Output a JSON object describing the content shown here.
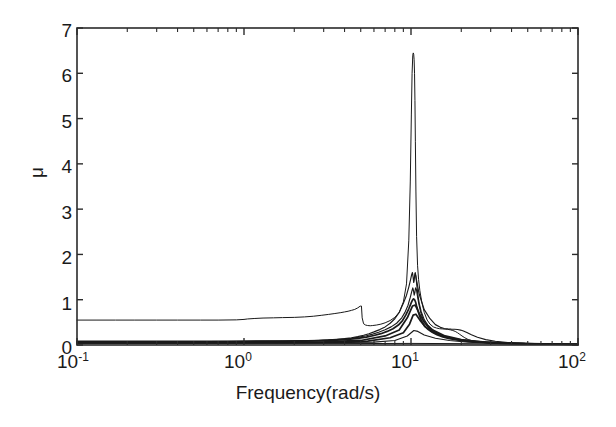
{
  "chart_data": {
    "type": "line",
    "title": "",
    "subtitle": "",
    "xlabel": "Frequency(rad/s)",
    "ylabel": "μ",
    "xscale": "log",
    "yscale": "linear",
    "xlim": [
      0.1,
      100
    ],
    "ylim": [
      0,
      7
    ],
    "grid": false,
    "legend": null,
    "legend_position": "none",
    "xticks": [
      0.1,
      1,
      10,
      100
    ],
    "xtick_labels": [
      "10⁻¹",
      "10⁰",
      "10¹",
      "10²"
    ],
    "xtick_mantissas": [
      "10",
      "10",
      "10",
      "10"
    ],
    "xtick_exponents": [
      "-1",
      "0",
      "1",
      "2"
    ],
    "yticks": [
      0,
      1,
      2,
      3,
      4,
      5,
      6,
      7
    ],
    "ytick_labels": [
      "0",
      "1",
      "2",
      "3",
      "4",
      "5",
      "6",
      "7"
    ],
    "minor_ticks": true,
    "line_color": "#1a1a1a",
    "background_color": "#ffffff",
    "axis_color": "#2b2b2b",
    "annotations": [
      {
        "text": "main resonance peak",
        "x": 10.5,
        "y": 6.45
      },
      {
        "text": "secondary peaks cluster",
        "x": 10.6,
        "y": 1.6
      },
      {
        "text": "low-frequency plateau upper curve",
        "x": 0.1,
        "y": 0.55
      },
      {
        "text": "anti-resonance notch",
        "x": 5.6,
        "y": 0.42
      },
      {
        "text": "local bump before notch",
        "x": 5.0,
        "y": 0.86
      }
    ],
    "series": [
      {
        "name": "upper-bound-curve",
        "width": "thin",
        "x": [
          0.1,
          0.13,
          0.17,
          0.22,
          0.3,
          0.4,
          0.55,
          0.7,
          0.9,
          1.0,
          1.05,
          1.15,
          1.3,
          1.5,
          1.7,
          2.0,
          2.3,
          2.6,
          2.9,
          3.2,
          3.5,
          3.8,
          4.0,
          4.2,
          4.4,
          4.6,
          4.8,
          4.95,
          5.0,
          5.05,
          5.1,
          5.2,
          5.35,
          5.5,
          5.7,
          5.9,
          6.2,
          6.6,
          7.0,
          7.5,
          8.0,
          8.5,
          9.0,
          9.4,
          9.7,
          9.9,
          10.05,
          10.15,
          10.25,
          10.32,
          10.38,
          10.44,
          10.5,
          10.56,
          10.62,
          10.7,
          10.8,
          10.95,
          11.1,
          11.3,
          11.6,
          12.0,
          12.5,
          13.0,
          13.6,
          14.2,
          14.8,
          15.4,
          16.0,
          16.6,
          17.2,
          17.8,
          18.4,
          19.0,
          19.6,
          20.2,
          21.0,
          22.0,
          23.5,
          25.0,
          27.0,
          30.0,
          34.0,
          40.0,
          50.0,
          65.0,
          80.0,
          100.0
        ],
        "y": [
          0.55,
          0.55,
          0.55,
          0.55,
          0.55,
          0.55,
          0.55,
          0.55,
          0.555,
          0.565,
          0.575,
          0.585,
          0.595,
          0.6,
          0.605,
          0.61,
          0.62,
          0.635,
          0.655,
          0.675,
          0.695,
          0.715,
          0.73,
          0.745,
          0.765,
          0.785,
          0.82,
          0.855,
          0.86,
          0.86,
          0.6,
          0.47,
          0.44,
          0.43,
          0.425,
          0.43,
          0.44,
          0.46,
          0.49,
          0.54,
          0.61,
          0.72,
          0.95,
          1.35,
          2.3,
          3.6,
          5.1,
          6.0,
          6.4,
          6.45,
          6.42,
          6.3,
          6.0,
          5.4,
          4.5,
          3.4,
          2.4,
          1.75,
          1.45,
          1.2,
          0.95,
          0.72,
          0.55,
          0.46,
          0.4,
          0.375,
          0.36,
          0.355,
          0.35,
          0.345,
          0.335,
          0.32,
          0.3,
          0.27,
          0.235,
          0.2,
          0.16,
          0.12,
          0.09,
          0.07,
          0.055,
          0.04,
          0.03,
          0.025,
          0.02,
          0.015,
          0.012,
          0.01
        ]
      },
      {
        "name": "curve-peak-1p6",
        "width": "normal",
        "x": [
          0.1,
          0.2,
          0.4,
          0.8,
          1.2,
          1.8,
          2.4,
          2.8,
          3.2,
          3.6,
          4.0,
          4.4,
          4.8,
          5.2,
          5.6,
          6.0,
          6.5,
          7.0,
          7.5,
          8.0,
          8.5,
          9.0,
          9.4,
          9.7,
          9.95,
          10.1,
          10.2,
          10.3,
          10.38,
          10.45,
          10.52,
          10.6,
          10.7,
          10.85,
          11.0,
          11.2,
          11.5,
          12.0,
          12.6,
          13.2,
          14.0,
          15.0,
          16.0,
          17.5,
          19.0,
          21.0,
          23.5,
          26.0,
          30.0,
          35.0,
          42.0,
          55.0,
          70.0,
          100.0
        ],
        "y": [
          0.085,
          0.085,
          0.085,
          0.087,
          0.09,
          0.095,
          0.1,
          0.105,
          0.112,
          0.125,
          0.14,
          0.16,
          0.185,
          0.215,
          0.25,
          0.29,
          0.34,
          0.4,
          0.48,
          0.58,
          0.72,
          0.92,
          1.1,
          1.28,
          1.45,
          1.56,
          1.6,
          1.5,
          1.38,
          1.42,
          1.55,
          1.6,
          1.52,
          1.3,
          1.1,
          0.92,
          0.74,
          0.56,
          0.44,
          0.36,
          0.29,
          0.23,
          0.19,
          0.15,
          0.12,
          0.095,
          0.075,
          0.062,
          0.048,
          0.038,
          0.03,
          0.022,
          0.017,
          0.012
        ]
      },
      {
        "name": "curve-peak-1p25",
        "width": "normal",
        "x": [
          0.1,
          0.25,
          0.5,
          1.0,
          1.6,
          2.2,
          2.8,
          3.4,
          3.9,
          4.4,
          4.9,
          5.4,
          5.9,
          6.4,
          7.0,
          7.6,
          8.2,
          8.8,
          9.2,
          9.6,
          9.9,
          10.1,
          10.25,
          10.35,
          10.45,
          10.55,
          10.65,
          10.78,
          10.95,
          11.15,
          11.4,
          11.8,
          12.4,
          13.0,
          13.8,
          14.8,
          16.0,
          17.5,
          19.5,
          22.0,
          25.0,
          29.0,
          34.0,
          42.0,
          55.0,
          75.0,
          100.0
        ],
        "y": [
          0.075,
          0.075,
          0.076,
          0.078,
          0.082,
          0.09,
          0.1,
          0.115,
          0.13,
          0.15,
          0.175,
          0.205,
          0.24,
          0.28,
          0.335,
          0.4,
          0.48,
          0.6,
          0.72,
          0.88,
          1.05,
          1.18,
          1.26,
          1.2,
          1.1,
          1.16,
          1.26,
          1.22,
          1.06,
          0.9,
          0.74,
          0.57,
          0.43,
          0.35,
          0.28,
          0.22,
          0.175,
          0.14,
          0.108,
          0.085,
          0.068,
          0.053,
          0.042,
          0.032,
          0.024,
          0.017,
          0.013
        ]
      },
      {
        "name": "curve-peak-1p0",
        "width": "thick",
        "x": [
          0.1,
          0.3,
          0.6,
          1.1,
          1.7,
          2.3,
          3.0,
          3.6,
          4.2,
          4.8,
          5.4,
          6.0,
          6.6,
          7.2,
          7.8,
          8.4,
          8.9,
          9.3,
          9.7,
          10.0,
          10.2,
          10.35,
          10.5,
          10.65,
          10.8,
          11.0,
          11.25,
          11.6,
          12.1,
          12.7,
          13.4,
          14.3,
          15.5,
          17.0,
          19.0,
          21.5,
          24.5,
          28.0,
          33.0,
          40.0,
          52.0,
          70.0,
          100.0
        ],
        "y": [
          0.07,
          0.07,
          0.071,
          0.073,
          0.078,
          0.085,
          0.095,
          0.108,
          0.125,
          0.148,
          0.175,
          0.21,
          0.25,
          0.3,
          0.36,
          0.44,
          0.54,
          0.66,
          0.8,
          0.92,
          0.99,
          1.02,
          1.0,
          0.95,
          0.86,
          0.76,
          0.64,
          0.52,
          0.41,
          0.34,
          0.28,
          0.225,
          0.18,
          0.142,
          0.11,
          0.086,
          0.068,
          0.055,
          0.043,
          0.033,
          0.024,
          0.018,
          0.013
        ]
      },
      {
        "name": "baseline-curve-a",
        "width": "thick",
        "x": [
          0.1,
          0.5,
          1.5,
          3.0,
          5.0,
          7.0,
          8.5,
          9.5,
          10.2,
          10.6,
          11.2,
          12.0,
          13.5,
          16.0,
          20.0,
          26.0,
          35.0,
          50.0,
          75.0,
          100.0
        ],
        "y": [
          0.06,
          0.06,
          0.062,
          0.07,
          0.1,
          0.2,
          0.33,
          0.6,
          0.86,
          0.88,
          0.7,
          0.5,
          0.33,
          0.2,
          0.12,
          0.072,
          0.046,
          0.03,
          0.019,
          0.014
        ]
      },
      {
        "name": "baseline-curve-b",
        "width": "thick",
        "x": [
          0.1,
          0.6,
          1.8,
          3.5,
          5.5,
          7.5,
          9.0,
          9.8,
          10.3,
          10.7,
          11.3,
          12.2,
          13.8,
          16.5,
          21.0,
          28.0,
          38.0,
          55.0,
          80.0,
          100.0
        ],
        "y": [
          0.052,
          0.052,
          0.054,
          0.062,
          0.085,
          0.16,
          0.27,
          0.46,
          0.66,
          0.68,
          0.55,
          0.4,
          0.27,
          0.165,
          0.1,
          0.062,
          0.04,
          0.026,
          0.017,
          0.013
        ]
      },
      {
        "name": "baseline-curve-c",
        "width": "normal",
        "x": [
          0.1,
          1.0,
          3.0,
          6.0,
          8.0,
          9.5,
          10.4,
          11.0,
          12.0,
          14.0,
          17.0,
          22.0,
          30.0,
          45.0,
          70.0,
          100.0
        ],
        "y": [
          0.045,
          0.045,
          0.05,
          0.062,
          0.1,
          0.2,
          0.32,
          0.3,
          0.22,
          0.15,
          0.1,
          0.065,
          0.042,
          0.027,
          0.018,
          0.013
        ]
      },
      {
        "name": "baseline-flat",
        "width": "thin",
        "x": [
          0.1,
          1.0,
          5.0,
          10.0,
          20.0,
          50.0,
          100.0
        ],
        "y": [
          0.03,
          0.03,
          0.032,
          0.035,
          0.03,
          0.02,
          0.012
        ]
      },
      {
        "name": "right-shoulder-curve",
        "width": "normal",
        "x": [
          10.6,
          11.2,
          12.0,
          13.0,
          14.0,
          15.0,
          15.8,
          16.6,
          17.4,
          18.2,
          19.0,
          19.8,
          20.6,
          21.6,
          23.0,
          25.0,
          28.0,
          32.0,
          38.0,
          48.0,
          65.0,
          85.0,
          100.0
        ],
        "y": [
          1.58,
          1.12,
          0.78,
          0.58,
          0.45,
          0.39,
          0.365,
          0.355,
          0.35,
          0.348,
          0.342,
          0.33,
          0.31,
          0.275,
          0.225,
          0.17,
          0.118,
          0.082,
          0.055,
          0.036,
          0.023,
          0.016,
          0.013
        ]
      }
    ]
  },
  "axes": {
    "box": {
      "left": 77,
      "top": 28,
      "right": 578,
      "bottom": 345
    }
  }
}
